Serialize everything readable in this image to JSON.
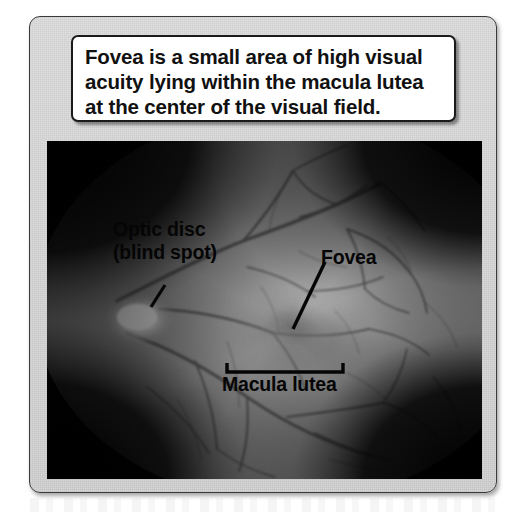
{
  "figure": {
    "caption": "Fovea is a small area of high visual\nacuity lying within the macula lutea\nat the center of the visual field.",
    "image_kind": "retinal-fundus-photograph",
    "colors": {
      "panel_background": "#d8d8d8",
      "panel_border": "#3a3a3a",
      "caption_background": "#ffffff",
      "caption_border": "#1a1a1a",
      "caption_text": "#111111",
      "photo_background": "#000000",
      "retina_base": "#9a9a9a",
      "optic_disc_highlight": "#ffffff",
      "macula_shadow": "#6e6e6e",
      "vessel_color": "#4a4a4a",
      "annotation_text": "#050505"
    },
    "annotations": [
      {
        "id": "optic-disc",
        "label": "Optic disc\n(blind spot)",
        "leader": "diagonal-line-down-left",
        "target": "bright optic disc"
      },
      {
        "id": "fovea",
        "label": "Fovea",
        "leader": "diagonal-line-down-left",
        "target": "dark foveal pit"
      },
      {
        "id": "macula-lutea",
        "label": "Macula lutea",
        "leader": "upward-bracket",
        "target": "darkened macular region"
      }
    ]
  }
}
